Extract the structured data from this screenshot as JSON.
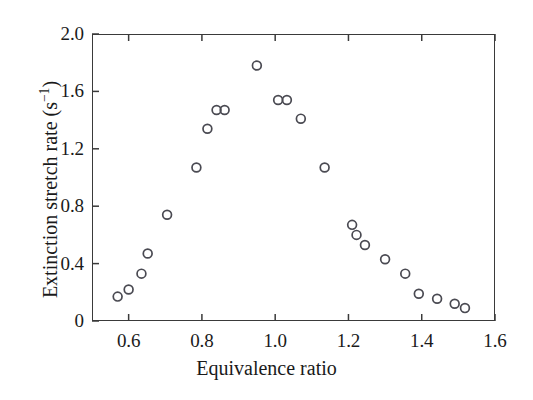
{
  "chart_data": {
    "type": "scatter",
    "title": "",
    "xlabel": "Equivalence ratio",
    "ylabel": "Extinction stretch rate (s⁻¹)",
    "ylabel_text": "Extinction stretch rate (s",
    "ylabel_sup": "−1",
    "ylabel_tail": ")",
    "xlim": [
      0.5,
      1.6
    ],
    "ylim": [
      0.0,
      2.0
    ],
    "xticks": [
      0.6,
      0.8,
      1.0,
      1.2,
      1.4,
      1.6
    ],
    "xtick_labels": [
      "0.6",
      "0.8",
      "1.0",
      "1.2",
      "1.4",
      "1.6"
    ],
    "yticks": [
      0.0,
      0.4,
      0.8,
      1.2,
      1.6,
      2.0
    ],
    "ytick_labels": [
      "0",
      "0.4",
      "0.8",
      "1.2",
      "1.6",
      "2.0"
    ],
    "grid": false,
    "legend": null,
    "marker": "open-circle",
    "marker_color": "#4a4a52",
    "marker_radius": 4.4,
    "series": [
      {
        "name": "Extinction stretch rate",
        "points": [
          [
            0.57,
            0.17
          ],
          [
            0.6,
            0.22
          ],
          [
            0.635,
            0.33
          ],
          [
            0.652,
            0.47
          ],
          [
            0.705,
            0.74
          ],
          [
            0.785,
            1.07
          ],
          [
            0.815,
            1.34
          ],
          [
            0.84,
            1.47
          ],
          [
            0.862,
            1.47
          ],
          [
            0.95,
            1.78
          ],
          [
            1.008,
            1.54
          ],
          [
            1.032,
            1.54
          ],
          [
            1.07,
            1.41
          ],
          [
            1.135,
            1.07
          ],
          [
            1.21,
            0.67
          ],
          [
            1.222,
            0.6
          ],
          [
            1.245,
            0.53
          ],
          [
            1.3,
            0.43
          ],
          [
            1.355,
            0.33
          ],
          [
            1.392,
            0.19
          ],
          [
            1.442,
            0.155
          ],
          [
            1.49,
            0.12
          ],
          [
            1.518,
            0.09
          ]
        ]
      }
    ]
  },
  "axes": {
    "frame_color": "#3a3a3a",
    "background": "#ffffff"
  }
}
